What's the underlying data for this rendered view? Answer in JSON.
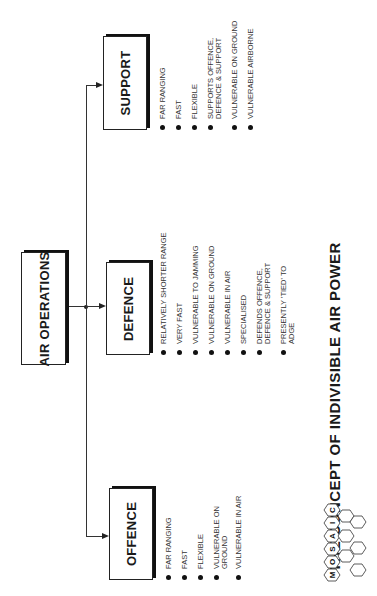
{
  "diagram": {
    "title": "THE CONCEPT OF INDIVISIBLE AIR POWER",
    "root": {
      "label": "AIR OPERATIONS"
    },
    "branches": [
      {
        "label": "SUPPORT",
        "bullets": [
          "FAR RANGING",
          "FAST",
          "FLEXIBLE",
          "SUPPORTS OFFENCE,\nDEFENCE & SUPPORT",
          "VULNERABLE ON GROUND",
          "VULNERABLE AIRBORNE"
        ]
      },
      {
        "label": "DEFENCE",
        "bullets": [
          "RELATIVELY SHORTER RANGE",
          "VERY FAST",
          "VULNERABLE TO JAMMING",
          "VULNERABLE ON GROUND",
          "VULNERABLE IN AIR",
          "SPECIALISED",
          "DEFENDS OFFENCE,\nDEFENCE & SUPPORT",
          "PRESENTLY 'TIED' TO\nADGE"
        ]
      },
      {
        "label": "OFFENCE",
        "bullets": [
          "FAR RANGING",
          "FAST",
          "FLEXIBLE",
          "VULNERABLE ON\nGROUND",
          "VULNERABLE IN AIR"
        ]
      }
    ],
    "logo": {
      "name": "MOSAIC",
      "letters": [
        "M",
        "O",
        "S",
        "A",
        "I",
        "C"
      ]
    },
    "colors": {
      "ink": "#1a1a1a",
      "background": "#ffffff"
    }
  }
}
